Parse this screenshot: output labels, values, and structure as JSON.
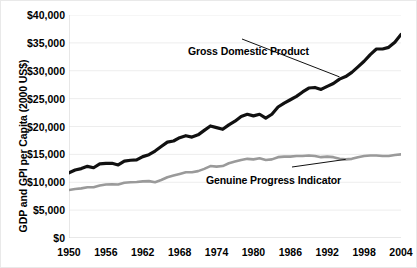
{
  "chart_data": {
    "type": "line",
    "title": "",
    "xlabel": "",
    "ylabel": "GDP and GPI per Capita (2000 US$)",
    "xlim": [
      1950,
      2004
    ],
    "ylim": [
      0,
      40000
    ],
    "ytick_labels": [
      "$40,000",
      "$35,000",
      "$30,000",
      "$25,000",
      "$20,000",
      "$15,000",
      "$10,000",
      "$5,000",
      "$0"
    ],
    "ytick_values": [
      40000,
      35000,
      30000,
      25000,
      20000,
      15000,
      10000,
      5000,
      0
    ],
    "xtick_labels": [
      "1950",
      "1956",
      "1962",
      "1968",
      "1974",
      "1980",
      "1986",
      "1992",
      "1998",
      "2004"
    ],
    "xtick_values": [
      1950,
      1956,
      1962,
      1968,
      1974,
      1980,
      1986,
      1992,
      1998,
      2004
    ],
    "grid": "horizontal",
    "legend": "annotations",
    "x": [
      1950,
      1951,
      1952,
      1953,
      1954,
      1955,
      1956,
      1957,
      1958,
      1959,
      1960,
      1961,
      1962,
      1963,
      1964,
      1965,
      1966,
      1967,
      1968,
      1969,
      1970,
      1971,
      1972,
      1973,
      1974,
      1975,
      1976,
      1977,
      1978,
      1979,
      1980,
      1981,
      1982,
      1983,
      1984,
      1985,
      1986,
      1987,
      1988,
      1989,
      1990,
      1991,
      1992,
      1993,
      1994,
      1995,
      1996,
      1997,
      1998,
      1999,
      2000,
      2001,
      2002,
      2003,
      2004
    ],
    "series": [
      {
        "name": "Gross Domestic Product",
        "color": "#111111",
        "width": 3.2,
        "values": [
          11700,
          12200,
          12450,
          12850,
          12600,
          13300,
          13400,
          13400,
          13100,
          13800,
          13950,
          14000,
          14600,
          14950,
          15600,
          16400,
          17200,
          17400,
          18000,
          18350,
          18100,
          18500,
          19300,
          20100,
          19800,
          19500,
          20300,
          20950,
          21800,
          22200,
          21900,
          22200,
          21500,
          22200,
          23500,
          24200,
          24800,
          25400,
          26200,
          26900,
          27000,
          26650,
          27200,
          27700,
          28500,
          28950,
          29700,
          30700,
          31700,
          32900,
          33900,
          33900,
          34200,
          35100,
          36500
        ]
      },
      {
        "name": "Genuine Progress Indicator",
        "color": "#9a9a9a",
        "width": 2.6,
        "values": [
          8600,
          8800,
          8900,
          9100,
          9100,
          9400,
          9600,
          9650,
          9600,
          9900,
          10000,
          10050,
          10150,
          10200,
          10000,
          10400,
          10900,
          11200,
          11500,
          11800,
          11800,
          12000,
          12400,
          12900,
          12800,
          12900,
          13400,
          13700,
          14000,
          14200,
          14100,
          14300,
          14000,
          14100,
          14500,
          14600,
          14600,
          14700,
          14700,
          14800,
          14700,
          14500,
          14600,
          14500,
          14200,
          14100,
          14200,
          14500,
          14700,
          14800,
          14800,
          14700,
          14700,
          14900,
          15000
        ]
      }
    ],
    "annotations": [
      {
        "text": "Gross Domestic Product",
        "target_x": 1994,
        "target_y": 28900
      },
      {
        "text": "Genuine Progress Indicator",
        "target_x": 1995,
        "target_y": 14100
      }
    ]
  }
}
